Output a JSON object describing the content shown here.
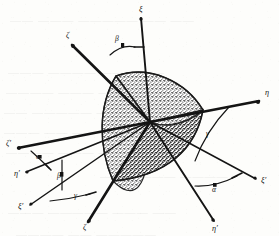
{
  "figure": {
    "kind": "spherical-triangle-diagram",
    "ink_color": "#141414",
    "stipple_color": "#565656",
    "paper_color": "#fdfdfb"
  },
  "origin": {
    "x": 150,
    "y": 122
  },
  "rays": [
    {
      "name": "ray-xi-top",
      "label": "ξ",
      "label_x": 139,
      "label_y": 12,
      "x1": 150,
      "y1": 122,
      "x2": 141,
      "y2": 18,
      "weight": 1.9
    },
    {
      "name": "ray-zeta-upleft",
      "label": "ζ",
      "label_x": 66,
      "label_y": 38,
      "x1": 150,
      "y1": 122,
      "x2": 72,
      "y2": 45,
      "weight": 2.6
    },
    {
      "name": "ray-eta-right",
      "label": "η",
      "label_x": 265,
      "label_y": 95,
      "x1": 150,
      "y1": 122,
      "x2": 259,
      "y2": 101,
      "weight": 2.6
    },
    {
      "name": "ray-zeta-prime-left",
      "label": "ζ′",
      "label_x": 10,
      "label_y": 146,
      "x1": 150,
      "y1": 122,
      "x2": 18,
      "y2": 148,
      "weight": 2.4
    },
    {
      "name": "ray-eta-prime-lowleft",
      "label": "η′",
      "label_x": 18,
      "label_y": 175,
      "x1": 150,
      "y1": 122,
      "x2": 26,
      "y2": 172,
      "weight": 1.5
    },
    {
      "name": "ray-xi-prime-lowleft",
      "label": "ξ′",
      "label_x": 22,
      "label_y": 208,
      "x1": 150,
      "y1": 122,
      "x2": 30,
      "y2": 205,
      "weight": 1.5
    },
    {
      "name": "ray-zeta-bottom",
      "label": "ζ",
      "label_x": 84,
      "label_y": 228,
      "x1": 150,
      "y1": 122,
      "x2": 88,
      "y2": 222,
      "weight": 2.6
    },
    {
      "name": "ray-eta-prime-low",
      "label": "η′",
      "label_x": 218,
      "label_y": 228,
      "x1": 150,
      "y1": 122,
      "x2": 214,
      "y2": 221,
      "weight": 1.9
    },
    {
      "name": "ray-xi-prime-right",
      "label": "ξ′",
      "label_x": 262,
      "label_y": 182,
      "x1": 150,
      "y1": 122,
      "x2": 256,
      "y2": 179,
      "weight": 1.5
    }
  ],
  "angle_marks": [
    {
      "name": "angle-beta-top",
      "label": "β",
      "label_x": 115,
      "label_y": 40,
      "arc": "M 110 55 Q 122 44 135 47",
      "tick_x1": 135,
      "tick_y1": 47,
      "tick_x2": 143,
      "tick_y2": 47
    },
    {
      "name": "angle-alpha-left",
      "label": "α",
      "label_x": 38,
      "label_y": 158,
      "arc": "M 30 152 Q 40 160 48 167",
      "tick_x1": 30,
      "tick_y1": 152,
      "tick_x2": 30,
      "tick_y2": 152
    },
    {
      "name": "angle-beta-lower-left",
      "label": "β",
      "label_x": 60,
      "label_y": 176,
      "arc": "M 62 162 L 62 188",
      "tick_x1": 62,
      "tick_y1": 162,
      "tick_x2": 62,
      "tick_y2": 188
    },
    {
      "name": "angle-gamma-bottom",
      "label": "γ",
      "label_x": 76,
      "label_y": 196,
      "arc": "M 52 200 Q 70 198 88 195",
      "tick_x1": 88,
      "tick_y1": 195,
      "tick_x2": 96,
      "tick_y2": 193
    },
    {
      "name": "angle-gamma-right",
      "label": "γ",
      "label_x": 208,
      "label_y": 134,
      "arc": "M 228 108 Q 207 130 196 160",
      "tick_x1": 228,
      "tick_y1": 108,
      "tick_x2": 228,
      "tick_y2": 108
    },
    {
      "name": "angle-alpha-lower-right",
      "label": "α",
      "label_x": 216,
      "label_y": 190,
      "arc": "M 196 185 Q 216 186 236 177",
      "tick_x1": 236,
      "tick_y1": 177,
      "tick_x2": 244,
      "tick_y2": 173
    }
  ],
  "ghost_text": [
    {
      "text": "—— ———   ————— —— ——",
      "x": 10,
      "y": 14
    },
    {
      "text": "——— ———— ———  ——",
      "x": 8,
      "y": 66
    },
    {
      "text": "———— ——— ————— ——",
      "x": 6,
      "y": 86
    },
    {
      "text": "—— ————— ——— ———",
      "x": 4,
      "y": 106
    },
    {
      "text": "——— —— ———— ————",
      "x": 4,
      "y": 126
    },
    {
      "text": "———— ——— —— ———",
      "x": 6,
      "y": 146
    },
    {
      "text": "—— ———— ————",
      "x": 100,
      "y": 170
    },
    {
      "text": "——— ————— ——— ——",
      "x": 8,
      "y": 206
    },
    {
      "text": "———— —— —————",
      "x": 16,
      "y": 228
    }
  ]
}
